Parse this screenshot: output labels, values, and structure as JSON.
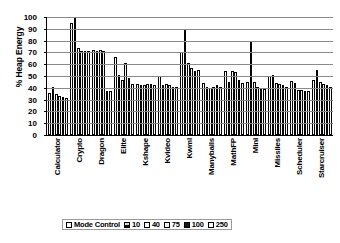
{
  "chart_data": {
    "type": "bar",
    "title": "",
    "xlabel": "",
    "ylabel": "% Heap Energy",
    "ylim": [
      0,
      100
    ],
    "yticks": [
      0,
      10,
      20,
      30,
      40,
      50,
      60,
      70,
      80,
      90,
      100
    ],
    "grid": true,
    "legend_position": "bottom",
    "categories": [
      "Calculator",
      "Crypto",
      "Dragon",
      "Elite",
      "Kshape",
      "Kvideo",
      "Kwml",
      "Manyballs",
      "MathFP",
      "Mini",
      "Missiles",
      "Scheduler",
      "Starcruiser"
    ],
    "series": [
      {
        "name": "Mode Control",
        "color": "#ffffff",
        "values": [
          36,
          95,
          72,
          66,
          43,
          50,
          70,
          44,
          54,
          45,
          50,
          46,
          47
        ]
      },
      {
        "name": "10",
        "color": "#777777",
        "values": [
          41,
          100,
          71,
          51,
          42,
          42,
          90,
          41,
          45,
          80,
          51,
          44,
          55
        ]
      },
      {
        "name": "40",
        "color": "#ffffff",
        "values": [
          35,
          74,
          72,
          47,
          42,
          43,
          61,
          40,
          54,
          45,
          44,
          38,
          45
        ]
      },
      {
        "name": "75",
        "color": "#f2f2f2",
        "values": [
          33,
          71,
          71,
          61,
          43,
          42,
          57,
          41,
          53,
          41,
          43,
          38,
          43
        ]
      },
      {
        "name": "100",
        "color": "#1a1a1a",
        "values": [
          32,
          71,
          37,
          48,
          43,
          41,
          54,
          42,
          47,
          40,
          42,
          37,
          42
        ]
      },
      {
        "name": "250",
        "color": "#ffffff",
        "values": [
          31,
          71,
          37,
          43,
          42,
          41,
          55,
          41,
          44,
          39,
          41,
          37,
          41
        ]
      }
    ]
  },
  "legend": {
    "items": [
      {
        "label": "Mode Control"
      },
      {
        "label": "10"
      },
      {
        "label": "40"
      },
      {
        "label": "75"
      },
      {
        "label": "100"
      },
      {
        "label": "250"
      }
    ]
  }
}
